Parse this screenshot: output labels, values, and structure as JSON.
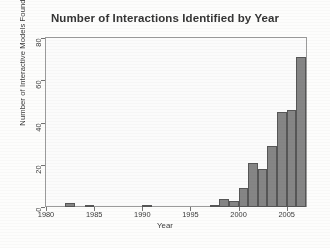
{
  "chart_data": {
    "type": "bar",
    "title": "Number of Interactions Identified by Year",
    "xlabel": "Year",
    "ylabel": "Number of Interactive Models Found",
    "categories": [
      1980,
      1981,
      1982,
      1983,
      1984,
      1985,
      1986,
      1987,
      1988,
      1989,
      1990,
      1991,
      1992,
      1993,
      1994,
      1995,
      1996,
      1997,
      1998,
      1999,
      2000,
      2001,
      2002,
      2003,
      2004,
      2005,
      2006
    ],
    "values": [
      0,
      0,
      2,
      0,
      1,
      0,
      0,
      0,
      0,
      0,
      1,
      0,
      0,
      0,
      0,
      0,
      0,
      1,
      4,
      3,
      9,
      21,
      18,
      29,
      45,
      46,
      71
    ],
    "xlim": [
      1980,
      2007
    ],
    "ylim": [
      0,
      80
    ],
    "xticks": [
      1980,
      1985,
      1990,
      1995,
      2000,
      2005
    ],
    "yticks": [
      0,
      20,
      40,
      60,
      80
    ],
    "grid": false,
    "legend": false,
    "bar_color": "#838383",
    "bar_edge_color": "#515151"
  },
  "axes": {
    "y_tick_labels": [
      "0",
      "20",
      "40",
      "60",
      "80"
    ],
    "x_tick_labels": [
      "1980",
      "1985",
      "1990",
      "1995",
      "2000",
      "2005"
    ]
  }
}
